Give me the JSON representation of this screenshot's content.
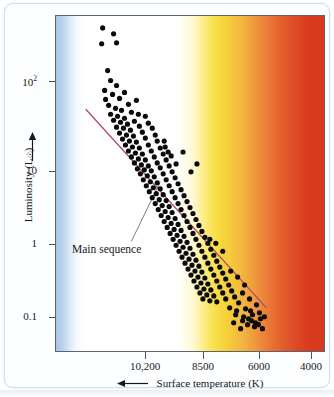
{
  "figure": {
    "kind": "hertzsprung-russell-diagram"
  },
  "chart_data": {
    "type": "scatter",
    "title": "",
    "xlabel": "Surface temperature (K)",
    "ylabel": "Luminosity (L☉)",
    "xlabel_arrow": "left-arrow",
    "ylabel_arrow": "up-arrow",
    "x_scale": "log-reversed",
    "y_scale": "log",
    "xlim": [
      11500,
      3100
    ],
    "ylim": [
      0.06,
      600
    ],
    "grid": false,
    "legend": "none",
    "xticks": [
      {
        "value": 10200,
        "label": "10,200",
        "px": 90
      },
      {
        "value": 8500,
        "label": "8500",
        "px": 148
      },
      {
        "value": 6000,
        "label": "6000",
        "px": 204
      },
      {
        "value": 4000,
        "label": "4000",
        "px": 256
      }
    ],
    "yticks": [
      {
        "value": 100,
        "label": "10",
        "exponent": "2",
        "px": 77
      },
      {
        "value": 10,
        "label": "10",
        "exponent": "",
        "px": 167
      },
      {
        "value": 1,
        "label": "1",
        "exponent": "",
        "px": 240
      },
      {
        "value": 0.1,
        "label": "0.1",
        "exponent": "",
        "px": 313
      }
    ],
    "annotations": [
      {
        "text": "Main sequence",
        "label_px": [
          67,
          240
        ],
        "leader_from_px": [
          126,
          238
        ],
        "leader_to_px": [
          155,
          178
        ]
      }
    ],
    "fit_line": {
      "name": "main-sequence-fit",
      "color": "#b4466a",
      "from_px": [
        80,
        105
      ],
      "to_px": [
        262,
        305
      ]
    },
    "background_bands": [
      {
        "name": "blue-band",
        "color": "#a8c6e4",
        "x_px": [
          0,
          20
        ]
      },
      {
        "name": "white-band",
        "color": "#ffffff",
        "x_px": [
          20,
          122
        ]
      },
      {
        "name": "yellow-band",
        "color": "#f7dc45",
        "x_px": [
          136,
          176
        ]
      },
      {
        "name": "orange-band",
        "color": "#ef9a3c",
        "x_px": [
          176,
          228
        ]
      },
      {
        "name": "red-band",
        "color": "#d6381d",
        "x_px": [
          228,
          270
        ]
      }
    ],
    "series": [
      {
        "name": "stars",
        "marker": "filled-circle",
        "color": "#0a0a0a",
        "point_count": 196,
        "points_px": [
          [
            97,
            23
          ],
          [
            108,
            29
          ],
          [
            96,
            39
          ],
          [
            111,
            38
          ],
          [
            102,
            66
          ],
          [
            105,
            76
          ],
          [
            111,
            81
          ],
          [
            99,
            86
          ],
          [
            107,
            90
          ],
          [
            100,
            95
          ],
          [
            114,
            94
          ],
          [
            119,
            88
          ],
          [
            103,
            101
          ],
          [
            110,
            104
          ],
          [
            123,
            100
          ],
          [
            131,
            96
          ],
          [
            116,
            106
          ],
          [
            105,
            110
          ],
          [
            112,
            112
          ],
          [
            126,
            108
          ],
          [
            119,
            114
          ],
          [
            133,
            110
          ],
          [
            108,
            116
          ],
          [
            115,
            118
          ],
          [
            122,
            120
          ],
          [
            129,
            117
          ],
          [
            140,
            112
          ],
          [
            111,
            123
          ],
          [
            118,
            124
          ],
          [
            125,
            126
          ],
          [
            134,
            122
          ],
          [
            143,
            119
          ],
          [
            114,
            129
          ],
          [
            121,
            131
          ],
          [
            128,
            132
          ],
          [
            137,
            128
          ],
          [
            147,
            124
          ],
          [
            117,
            135
          ],
          [
            124,
            137
          ],
          [
            131,
            138
          ],
          [
            140,
            134
          ],
          [
            150,
            131
          ],
          [
            120,
            141
          ],
          [
            127,
            143
          ],
          [
            134,
            144
          ],
          [
            143,
            141
          ],
          [
            152,
            137
          ],
          [
            123,
            147
          ],
          [
            130,
            149
          ],
          [
            137,
            150
          ],
          [
            146,
            147
          ],
          [
            155,
            144
          ],
          [
            126,
            153
          ],
          [
            133,
            155
          ],
          [
            140,
            156
          ],
          [
            149,
            153
          ],
          [
            158,
            150
          ],
          [
            129,
            159
          ],
          [
            136,
            161
          ],
          [
            143,
            162
          ],
          [
            152,
            159
          ],
          [
            161,
            156
          ],
          [
            132,
            165
          ],
          [
            139,
            166
          ],
          [
            146,
            167
          ],
          [
            155,
            164
          ],
          [
            164,
            162
          ],
          [
            135,
            170
          ],
          [
            142,
            172
          ],
          [
            149,
            173
          ],
          [
            158,
            170
          ],
          [
            167,
            168
          ],
          [
            160,
            143
          ],
          [
            163,
            148
          ],
          [
            166,
            152
          ],
          [
            159,
            137
          ],
          [
            138,
            176
          ],
          [
            145,
            178
          ],
          [
            152,
            179
          ],
          [
            161,
            176
          ],
          [
            170,
            174
          ],
          [
            141,
            182
          ],
          [
            148,
            184
          ],
          [
            155,
            185
          ],
          [
            164,
            182
          ],
          [
            173,
            180
          ],
          [
            144,
            188
          ],
          [
            151,
            190
          ],
          [
            158,
            191
          ],
          [
            167,
            188
          ],
          [
            176,
            186
          ],
          [
            147,
            194
          ],
          [
            154,
            196
          ],
          [
            161,
            197
          ],
          [
            170,
            194
          ],
          [
            179,
            192
          ],
          [
            150,
            200
          ],
          [
            157,
            202
          ],
          [
            164,
            203
          ],
          [
            173,
            200
          ],
          [
            182,
            198
          ],
          [
            153,
            206
          ],
          [
            160,
            208
          ],
          [
            167,
            209
          ],
          [
            176,
            206
          ],
          [
            185,
            204
          ],
          [
            156,
            212
          ],
          [
            163,
            214
          ],
          [
            170,
            215
          ],
          [
            179,
            212
          ],
          [
            188,
            210
          ],
          [
            159,
            218
          ],
          [
            166,
            220
          ],
          [
            173,
            221
          ],
          [
            182,
            218
          ],
          [
            191,
            216
          ],
          [
            162,
            224
          ],
          [
            169,
            226
          ],
          [
            176,
            227
          ],
          [
            185,
            224
          ],
          [
            194,
            222
          ],
          [
            165,
            230
          ],
          [
            172,
            232
          ],
          [
            179,
            233
          ],
          [
            188,
            230
          ],
          [
            197,
            228
          ],
          [
            168,
            236
          ],
          [
            175,
            238
          ],
          [
            182,
            239
          ],
          [
            191,
            236
          ],
          [
            200,
            234
          ],
          [
            171,
            242
          ],
          [
            178,
            244
          ],
          [
            185,
            245
          ],
          [
            194,
            242
          ],
          [
            203,
            240
          ],
          [
            174,
            248
          ],
          [
            181,
            250
          ],
          [
            188,
            251
          ],
          [
            197,
            248
          ],
          [
            206,
            246
          ],
          [
            177,
            254
          ],
          [
            184,
            256
          ],
          [
            191,
            257
          ],
          [
            200,
            254
          ],
          [
            209,
            252
          ],
          [
            180,
            260
          ],
          [
            187,
            262
          ],
          [
            194,
            263
          ],
          [
            203,
            260
          ],
          [
            212,
            258
          ],
          [
            183,
            266
          ],
          [
            190,
            268
          ],
          [
            197,
            269
          ],
          [
            206,
            266
          ],
          [
            215,
            264
          ],
          [
            186,
            272
          ],
          [
            193,
            274
          ],
          [
            200,
            275
          ],
          [
            209,
            272
          ],
          [
            218,
            270
          ],
          [
            189,
            278
          ],
          [
            196,
            280
          ],
          [
            203,
            281
          ],
          [
            212,
            278
          ],
          [
            221,
            276
          ],
          [
            192,
            284
          ],
          [
            199,
            286
          ],
          [
            206,
            287
          ],
          [
            215,
            284
          ],
          [
            224,
            282
          ],
          [
            195,
            290
          ],
          [
            202,
            292
          ],
          [
            209,
            293
          ],
          [
            218,
            290
          ],
          [
            227,
            288
          ],
          [
            198,
            296
          ],
          [
            205,
            298
          ],
          [
            212,
            299
          ],
          [
            221,
            296
          ],
          [
            230,
            294
          ],
          [
            211,
            240
          ],
          [
            218,
            248
          ],
          [
            205,
            236
          ],
          [
            226,
            268
          ],
          [
            233,
            274
          ],
          [
            240,
            282
          ],
          [
            238,
            290
          ],
          [
            245,
            296
          ],
          [
            252,
            302
          ],
          [
            246,
            308
          ],
          [
            234,
            300
          ],
          [
            241,
            306
          ],
          [
            248,
            312
          ],
          [
            255,
            310
          ],
          [
            231,
            312
          ],
          [
            238,
            318
          ],
          [
            244,
            316
          ],
          [
            251,
            320
          ],
          [
            225,
            305
          ],
          [
            232,
            308
          ],
          [
            239,
            314
          ],
          [
            256,
            316
          ],
          [
            243,
            322
          ],
          [
            250,
            324
          ],
          [
            236,
            326
          ],
          [
            229,
            320
          ],
          [
            247,
            318
          ],
          [
            254,
            322
          ],
          [
            260,
            314
          ],
          [
            258,
            326
          ],
          [
            178,
            148
          ],
          [
            171,
            160
          ],
          [
            186,
            168
          ],
          [
            192,
            160
          ]
        ]
      }
    ]
  }
}
